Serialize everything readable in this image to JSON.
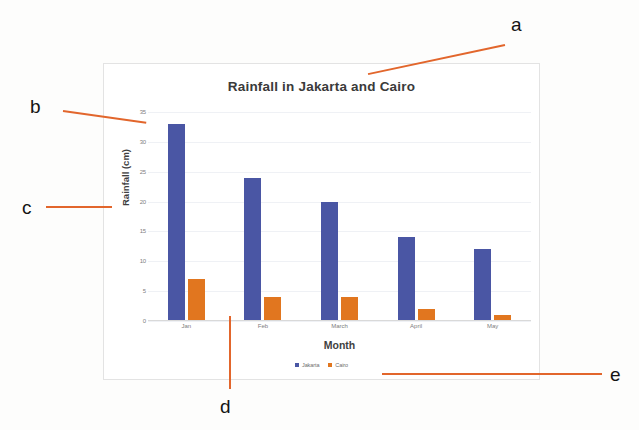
{
  "chart_data": {
    "type": "bar",
    "title": "Rainfall in Jakarta and Cairo",
    "xlabel": "Month",
    "ylabel": "Rainfall (cm)",
    "categories": [
      "Jan",
      "Feb",
      "March",
      "April",
      "May"
    ],
    "series": [
      {
        "name": "Jakarta",
        "color": "#4a56a4",
        "values": [
          33,
          24,
          20,
          14,
          12
        ]
      },
      {
        "name": "Cairo",
        "color": "#e1761f",
        "values": [
          7,
          4,
          4,
          2,
          1
        ]
      }
    ],
    "ylim": [
      0,
      35
    ],
    "yticks": [
      0,
      5,
      10,
      15,
      20,
      25,
      30,
      35
    ],
    "ytick_labels": [
      "0",
      "5",
      "10",
      "15",
      "20",
      "25",
      "30",
      "35"
    ],
    "grid": true,
    "legend_position": "bottom"
  },
  "annotations": {
    "accent_color": "#e2662c",
    "labels": [
      {
        "id": "a",
        "text": "a",
        "target": "chart-title"
      },
      {
        "id": "b",
        "text": "b",
        "target": "y-axis-max-tick"
      },
      {
        "id": "c",
        "text": "c",
        "target": "y-axis-title"
      },
      {
        "id": "d",
        "text": "d",
        "target": "x-axis-category"
      },
      {
        "id": "e",
        "text": "e",
        "target": "legend"
      }
    ]
  }
}
